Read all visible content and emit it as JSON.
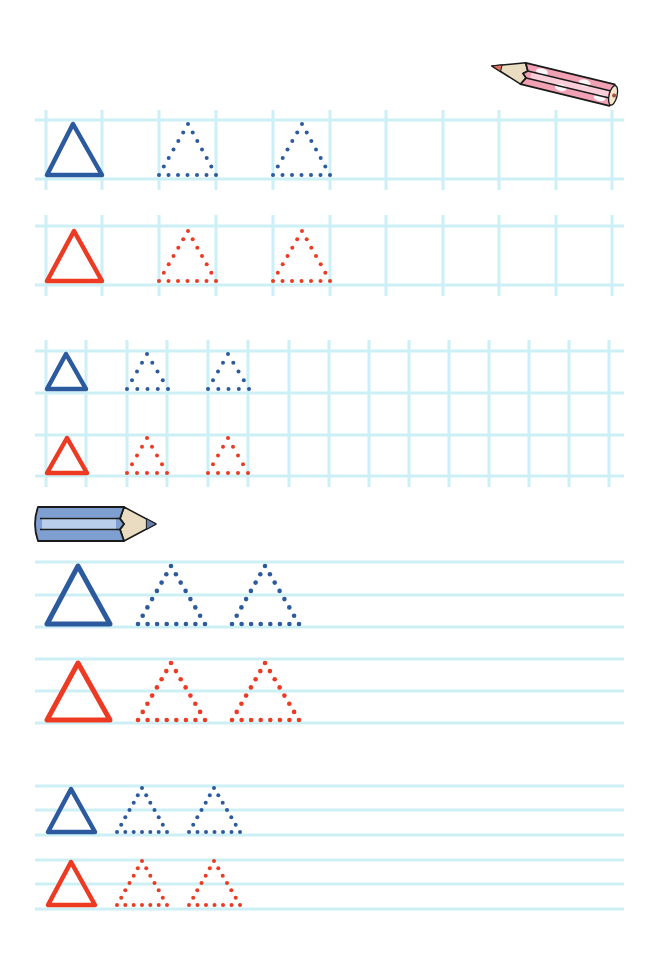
{
  "page": {
    "width": 658,
    "height": 953,
    "background": "#ffffff"
  },
  "colors": {
    "grid": "#cdeff6",
    "blue": "#2c5a9e",
    "red": "#ee3a22",
    "pencil_pink": "#f2a0b4",
    "pencil_pink_light": "#fbd6df",
    "pencil_blue": "#7e9fd0",
    "pencil_blue_light": "#c3d6ef",
    "pencil_wood": "#e9dcc0",
    "outline": "#1a1a1a"
  },
  "decorations": [
    {
      "name": "pink-pencil-icon",
      "kind": "pencil",
      "color": "pink",
      "tip": [
        492,
        66
      ],
      "end": [
        616,
        96
      ],
      "thickness": 24
    },
    {
      "name": "blue-pencil-icon",
      "kind": "pencil",
      "color": "blue",
      "tip": [
        156,
        524
      ],
      "end": [
        34,
        524
      ],
      "thickness": 36
    }
  ],
  "sections": [
    {
      "name": "section-grid-large",
      "type": "grid",
      "x_start": 35,
      "x_end": 624,
      "vlines": [
        46,
        102,
        159,
        216,
        273,
        330,
        386,
        443,
        499,
        556,
        612
      ],
      "rows": [
        {
          "color": "blue",
          "top": 120,
          "bottom": 179,
          "v_top": 110,
          "v_bottom": 190
        },
        {
          "color": "red",
          "top": 226,
          "bottom": 285,
          "v_top": 215,
          "v_bottom": 296
        }
      ],
      "shapes": [
        {
          "row": 0,
          "type": "solid",
          "apex": [
            73,
            124
          ],
          "left": [
            47,
            175
          ],
          "right": [
            102,
            175
          ]
        },
        {
          "row": 0,
          "type": "dotted",
          "apex": [
            188,
            124
          ],
          "left": [
            159,
            175
          ],
          "right": [
            216,
            175
          ],
          "dots_per_side": 7
        },
        {
          "row": 0,
          "type": "dotted",
          "apex": [
            302,
            124
          ],
          "left": [
            273,
            175
          ],
          "right": [
            330,
            175
          ],
          "dots_per_side": 7
        },
        {
          "row": 1,
          "type": "solid",
          "apex": [
            74,
            231
          ],
          "left": [
            47,
            281
          ],
          "right": [
            102,
            281
          ]
        },
        {
          "row": 1,
          "type": "dotted",
          "apex": [
            188,
            231
          ],
          "left": [
            159,
            281
          ],
          "right": [
            216,
            281
          ],
          "dots_per_side": 7
        },
        {
          "row": 1,
          "type": "dotted",
          "apex": [
            302,
            231
          ],
          "left": [
            273,
            281
          ],
          "right": [
            330,
            281
          ],
          "dots_per_side": 7
        }
      ]
    },
    {
      "name": "section-grid-small",
      "type": "grid",
      "x_start": 35,
      "x_end": 624,
      "vlines": [
        46,
        86,
        127,
        167,
        208,
        248,
        289,
        329,
        369,
        409,
        449,
        489,
        529,
        569,
        609
      ],
      "continuous_v": true,
      "v_top": 340,
      "v_bottom": 487,
      "rows": [
        {
          "color": "blue",
          "top": 351,
          "bottom": 393
        },
        {
          "color": "red",
          "top": 435,
          "bottom": 476
        }
      ],
      "shapes": [
        {
          "row": 0,
          "type": "solid",
          "apex": [
            66,
            354
          ],
          "left": [
            47,
            389
          ],
          "right": [
            86,
            389
          ]
        },
        {
          "row": 0,
          "type": "dotted",
          "apex": [
            147,
            354
          ],
          "left": [
            127,
            389
          ],
          "right": [
            168,
            389
          ],
          "dots_per_side": 5
        },
        {
          "row": 0,
          "type": "dotted",
          "apex": [
            228,
            354
          ],
          "left": [
            208,
            389
          ],
          "right": [
            249,
            389
          ],
          "dots_per_side": 5
        },
        {
          "row": 1,
          "type": "solid",
          "apex": [
            67,
            438
          ],
          "left": [
            47,
            473
          ],
          "right": [
            87,
            473
          ]
        },
        {
          "row": 1,
          "type": "dotted",
          "apex": [
            147,
            438
          ],
          "left": [
            127,
            473
          ],
          "right": [
            167,
            473
          ],
          "dots_per_side": 5
        },
        {
          "row": 1,
          "type": "dotted",
          "apex": [
            228,
            438
          ],
          "left": [
            208,
            473
          ],
          "right": [
            248,
            473
          ],
          "dots_per_side": 5
        }
      ]
    },
    {
      "name": "section-lined-large",
      "type": "lined",
      "x_start": 35,
      "x_end": 624,
      "hlines": [
        562,
        595,
        627,
        659,
        691,
        723
      ],
      "rows": [
        {
          "color": "blue",
          "top": 562,
          "bottom": 627
        },
        {
          "color": "red",
          "top": 659,
          "bottom": 723
        }
      ],
      "shapes": [
        {
          "row": 0,
          "type": "solid",
          "apex": [
            78,
            566
          ],
          "left": [
            47,
            624
          ],
          "right": [
            110,
            624
          ]
        },
        {
          "row": 0,
          "type": "dotted",
          "apex": [
            171,
            566
          ],
          "left": [
            138,
            624
          ],
          "right": [
            205,
            624
          ],
          "dots_per_side": 8
        },
        {
          "row": 0,
          "type": "dotted",
          "apex": [
            265,
            566
          ],
          "left": [
            232,
            624
          ],
          "right": [
            299,
            624
          ],
          "dots_per_side": 8
        },
        {
          "row": 1,
          "type": "solid",
          "apex": [
            78,
            663
          ],
          "left": [
            47,
            720
          ],
          "right": [
            110,
            720
          ]
        },
        {
          "row": 1,
          "type": "dotted",
          "apex": [
            171,
            663
          ],
          "left": [
            138,
            720
          ],
          "right": [
            205,
            720
          ],
          "dots_per_side": 8
        },
        {
          "row": 1,
          "type": "dotted",
          "apex": [
            265,
            663
          ],
          "left": [
            232,
            720
          ],
          "right": [
            299,
            720
          ],
          "dots_per_side": 8
        }
      ]
    },
    {
      "name": "section-lined-small",
      "type": "lined",
      "x_start": 35,
      "x_end": 624,
      "hlines": [
        786,
        810,
        835,
        860,
        884,
        909
      ],
      "rows": [
        {
          "color": "blue",
          "top": 786,
          "bottom": 835
        },
        {
          "color": "red",
          "top": 860,
          "bottom": 909
        }
      ],
      "shapes": [
        {
          "row": 0,
          "type": "solid",
          "apex": [
            71,
            789
          ],
          "left": [
            48,
            832
          ],
          "right": [
            95,
            832
          ]
        },
        {
          "row": 0,
          "type": "dotted",
          "apex": [
            142,
            788
          ],
          "left": [
            117,
            832
          ],
          "right": [
            167,
            832
          ],
          "dots_per_side": 7
        },
        {
          "row": 0,
          "type": "dotted",
          "apex": [
            214,
            788
          ],
          "left": [
            189,
            832
          ],
          "right": [
            240,
            832
          ],
          "dots_per_side": 7
        },
        {
          "row": 1,
          "type": "solid",
          "apex": [
            71,
            862
          ],
          "left": [
            48,
            905
          ],
          "right": [
            95,
            905
          ]
        },
        {
          "row": 1,
          "type": "dotted",
          "apex": [
            142,
            861
          ],
          "left": [
            117,
            905
          ],
          "right": [
            167,
            905
          ],
          "dots_per_side": 7
        },
        {
          "row": 1,
          "type": "dotted",
          "apex": [
            214,
            861
          ],
          "left": [
            189,
            905
          ],
          "right": [
            240,
            905
          ],
          "dots_per_side": 7
        }
      ]
    }
  ]
}
